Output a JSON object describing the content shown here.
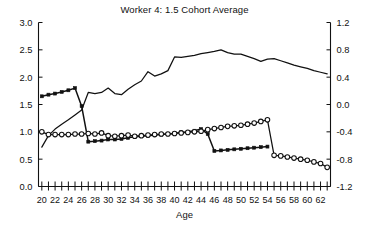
{
  "chart_data": {
    "type": "line",
    "title": "Worker 4: 1.5 Cohort Average",
    "xlabel": "Age",
    "ylabel": "",
    "xlim": [
      19.5,
      63.5
    ],
    "xticks": [
      20,
      21,
      22,
      23,
      24,
      25,
      26,
      27,
      28,
      29,
      30,
      31,
      32,
      33,
      34,
      35,
      36,
      37,
      38,
      39,
      40,
      41,
      42,
      43,
      44,
      45,
      46,
      47,
      48,
      49,
      50,
      51,
      52,
      53,
      54,
      55,
      56,
      57,
      58,
      59,
      60,
      61,
      62,
      63
    ],
    "xtick_labels": [
      "20",
      "",
      "22",
      "",
      "24",
      "",
      "26",
      "",
      "28",
      "",
      "30",
      "",
      "32",
      "",
      "34",
      "",
      "36",
      "",
      "38",
      "",
      "40",
      "",
      "42",
      "",
      "44",
      "",
      "46",
      "",
      "48",
      "",
      "50",
      "",
      "52",
      "",
      "54",
      "",
      "56",
      "",
      "58",
      "",
      "60",
      "",
      "62",
      ""
    ],
    "ylim_left": [
      0.0,
      3.0
    ],
    "yticks_left": [
      0.0,
      0.5,
      1.0,
      1.5,
      2.0,
      2.5,
      3.0
    ],
    "ytick_labels_left": [
      "0.0",
      "0.5",
      "1.0",
      "1.5",
      "2.0",
      "2.5",
      "3.0"
    ],
    "ylim_right": [
      -1.2,
      1.2
    ],
    "yticks_right": [
      -1.2,
      -0.8,
      -0.4,
      0.0,
      0.4,
      0.8,
      1.2
    ],
    "ytick_labels_right": [
      "-1.2",
      "-0.8",
      "-0.4",
      "0.0",
      "0.4",
      "0.8",
      "1.2"
    ],
    "grid": false,
    "legend": "none",
    "x": [
      20,
      21,
      22,
      23,
      24,
      25,
      26,
      27,
      28,
      29,
      30,
      31,
      32,
      33,
      34,
      35,
      36,
      37,
      38,
      39,
      40,
      41,
      42,
      43,
      44,
      45,
      46,
      47,
      48,
      49,
      50,
      51,
      52,
      53,
      54,
      55,
      56,
      57,
      58,
      59,
      60,
      61,
      62,
      63
    ],
    "series": [
      {
        "name": "plain-line",
        "axis": "left",
        "marker": "none",
        "values": [
          0.72,
          0.93,
          1.05,
          1.14,
          1.22,
          1.31,
          1.4,
          1.72,
          1.7,
          1.72,
          1.8,
          1.7,
          1.68,
          1.78,
          1.86,
          1.93,
          2.1,
          2.02,
          2.06,
          2.12,
          2.37,
          2.36,
          2.38,
          2.4,
          2.43,
          2.45,
          2.47,
          2.5,
          2.45,
          2.42,
          2.42,
          2.38,
          2.34,
          2.29,
          2.33,
          2.34,
          2.3,
          2.26,
          2.22,
          2.19,
          2.16,
          2.12,
          2.09,
          2.06
        ]
      },
      {
        "name": "filled-marker-line",
        "axis": "left",
        "marker": "filled",
        "values": [
          1.65,
          1.68,
          1.7,
          1.73,
          1.76,
          1.8,
          1.47,
          0.82,
          0.83,
          0.84,
          0.86,
          0.86,
          0.87,
          0.89,
          0.91,
          0.92,
          0.93,
          0.94,
          0.95,
          0.96,
          0.97,
          0.99,
          1.0,
          1.02,
          1.05,
          0.96,
          0.65,
          0.66,
          0.67,
          0.68,
          0.69,
          0.7,
          0.71,
          0.72,
          0.73,
          null,
          null,
          null,
          null,
          null,
          null,
          null,
          null,
          null
        ]
      },
      {
        "name": "open-circle-line",
        "axis": "left",
        "marker": "open",
        "values": [
          1.0,
          0.95,
          0.95,
          0.95,
          0.95,
          0.96,
          0.96,
          0.97,
          0.96,
          0.98,
          0.93,
          0.92,
          0.93,
          0.94,
          0.92,
          0.93,
          0.94,
          0.95,
          0.96,
          0.96,
          0.97,
          0.98,
          0.99,
          1.0,
          1.01,
          1.04,
          1.06,
          1.08,
          1.1,
          1.11,
          1.12,
          1.14,
          1.16,
          1.19,
          1.22,
          0.57,
          0.56,
          0.54,
          0.52,
          0.5,
          0.48,
          0.45,
          0.42,
          0.35
        ]
      }
    ]
  }
}
